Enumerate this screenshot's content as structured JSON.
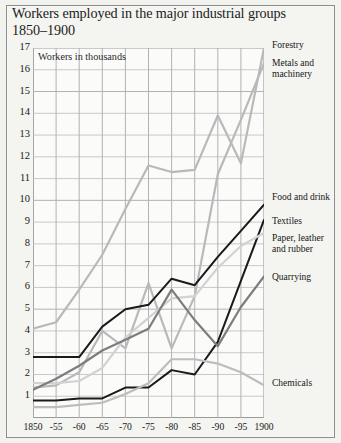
{
  "title": "Workers employed in the major industrial groups 1850–1900",
  "axis_note": "Workers in thousands",
  "legend": [
    {
      "key": "forestry",
      "label": "Forestry",
      "top": 40
    },
    {
      "key": "metals",
      "label": "Metals and\nmachinery",
      "top": 58
    },
    {
      "key": "food",
      "label": "Food and drink",
      "top": 192
    },
    {
      "key": "textiles",
      "label": "Textiles",
      "top": 216
    },
    {
      "key": "paper",
      "label": "Paper, leather\nand rubber",
      "top": 233
    },
    {
      "key": "quarrying",
      "label": "Quarrying",
      "top": 272
    },
    {
      "key": "chemicals",
      "label": "Chemicals",
      "top": 378
    }
  ],
  "y_ticks": [
    "17",
    "16",
    "15",
    "14",
    "13",
    "12",
    "11",
    "10",
    "9",
    "8",
    "7",
    "6",
    "5",
    "4",
    "3",
    "2",
    "1"
  ],
  "x_ticks": [
    "1850",
    "-55",
    "-60",
    "-65",
    "-70",
    "-75",
    "-80",
    "-85",
    "-90",
    "-95",
    "1900"
  ],
  "colors": {
    "page": "#f2f2ef",
    "panel": "#fbfbfa",
    "frame": "#8d8d8d",
    "grid": "#c9c9cb",
    "grid_major": "#b2b2b4",
    "forestry": "#b9b9b9",
    "metals": "#b9b9b9",
    "food": "#1a1a1a",
    "textiles": "#1a1a1a",
    "paper": "#d2d2d2",
    "quarrying": "#7d7d7d",
    "chemicals": "#bdbdbd"
  },
  "chart_data": {
    "type": "line",
    "title": "Workers employed in the major industrial groups 1850–1900",
    "xlabel": "",
    "ylabel": "Workers in thousands",
    "x": [
      1850,
      1855,
      1860,
      1865,
      1870,
      1875,
      1880,
      1885,
      1890,
      1895,
      1900
    ],
    "x_tick_labels": [
      "1850",
      "-55",
      "-60",
      "-65",
      "-70",
      "-75",
      "-80",
      "-85",
      "-90",
      "-95",
      "1900"
    ],
    "xlim": [
      1850,
      1900
    ],
    "ylim": [
      0,
      17
    ],
    "y_ticks": [
      1,
      2,
      3,
      4,
      5,
      6,
      7,
      8,
      9,
      10,
      11,
      12,
      13,
      14,
      15,
      16,
      17
    ],
    "grid": true,
    "legend_position": "right",
    "series": [
      {
        "name": "Forestry",
        "color": "#b9b9b9",
        "width": 2.2,
        "values": [
          4.1,
          4.4,
          5.9,
          7.5,
          9.6,
          11.6,
          11.3,
          11.4,
          13.9,
          11.7,
          17.0
        ]
      },
      {
        "name": "Metals and machinery",
        "color": "#b9b9b9",
        "width": 2.2,
        "values": [
          1.4,
          1.5,
          2.1,
          4.0,
          3.2,
          6.2,
          3.2,
          5.6,
          11.2,
          13.7,
          16.3
        ]
      },
      {
        "name": "Food and drink",
        "color": "#1a1a1a",
        "width": 2.0,
        "values": [
          2.8,
          2.8,
          2.8,
          4.2,
          5.0,
          5.2,
          6.4,
          6.1,
          7.4,
          8.6,
          9.8
        ]
      },
      {
        "name": "Textiles",
        "color": "#1a1a1a",
        "width": 2.0,
        "values": [
          0.8,
          0.8,
          0.9,
          0.9,
          1.4,
          1.4,
          2.2,
          2.0,
          3.5,
          6.3,
          9.1
        ]
      },
      {
        "name": "Paper, leather and rubber",
        "color": "#d2d2d2",
        "width": 2.2,
        "values": [
          1.6,
          1.6,
          1.7,
          2.3,
          3.7,
          4.6,
          5.5,
          5.6,
          6.9,
          7.9,
          8.5
        ]
      },
      {
        "name": "Quarrying",
        "color": "#7d7d7d",
        "width": 2.2,
        "values": [
          1.3,
          1.8,
          2.4,
          3.1,
          3.6,
          4.1,
          5.9,
          4.5,
          3.3,
          5.1,
          6.5
        ]
      },
      {
        "name": "Chemicals",
        "color": "#bdbdbd",
        "width": 2.2,
        "values": [
          0.5,
          0.5,
          0.6,
          0.7,
          1.1,
          1.6,
          2.7,
          2.7,
          2.5,
          2.1,
          1.5
        ]
      }
    ]
  }
}
